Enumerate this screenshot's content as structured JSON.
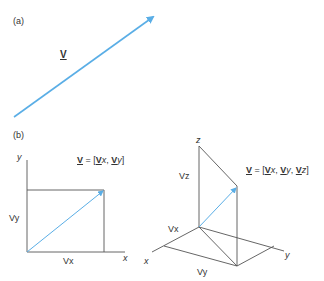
{
  "panel_a": {
    "label": "(a)",
    "vector_label": "V",
    "arrow_color": "#5aaee6"
  },
  "panel_b": {
    "label": "(b)",
    "two_d": {
      "axis_x": "x",
      "axis_y": "y",
      "component_x": "Vx",
      "component_y": "Vy",
      "formula": {
        "lhs": "V",
        "eq": " = [",
        "c1": "V",
        "c1s": "x",
        "sep1": ", ",
        "c2": "V",
        "c2s": "y",
        "close": "]"
      }
    },
    "three_d": {
      "axis_x": "x",
      "axis_y": "y",
      "axis_z": "z",
      "component_x": "Vx",
      "component_y": "Vy",
      "component_z": "Vz",
      "formula": {
        "lhs": "V",
        "eq": " = [",
        "c1": "V",
        "c1s": "x",
        "sep1": ", ",
        "c2": "V",
        "c2s": "y",
        "sep2": ", ",
        "c3": "V",
        "c3s": "z",
        "close": "]"
      }
    }
  },
  "colors": {
    "vector": "#5aaee6",
    "lines": "#555555"
  }
}
